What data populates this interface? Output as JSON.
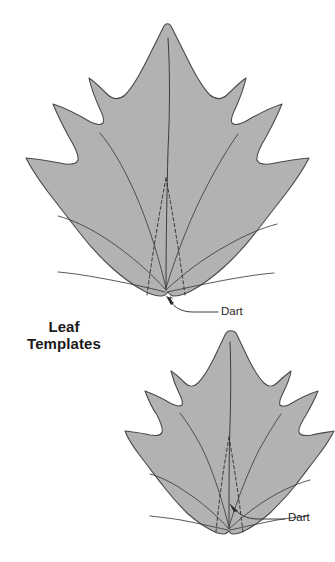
{
  "figure": {
    "caption_line1": "Leaf",
    "caption_line2": "Templates",
    "background_color": "#ffffff",
    "leaf_fill_color": "#b2b2b2",
    "leaf_outline_color": "#4a4a4a",
    "vein_color": "#3c3c3c",
    "dart_line_color": "#2e2e2e",
    "label_color": "#1f1f1f"
  },
  "annotations": {
    "upper_dart_label": "Dart",
    "lower_dart_label": "Dart"
  },
  "leaves": [
    {
      "name": "large-leaf-template",
      "position": "upper",
      "lobes": 5,
      "dart_count": 1
    },
    {
      "name": "small-leaf-template",
      "position": "lower",
      "lobes": 5,
      "dart_count": 1
    }
  ]
}
